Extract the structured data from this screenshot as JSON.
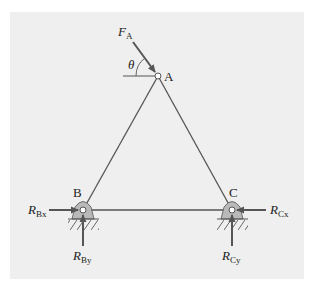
{
  "diagram": {
    "type": "truss-free-body-diagram",
    "colors": {
      "background": "#ffffff",
      "panel": "#efefef",
      "member": "#555555",
      "support_fill": "#b9b9b9",
      "hatch": "#666666",
      "text": "#222222"
    },
    "nodes": {
      "A": {
        "label": "A",
        "x": 158,
        "y": 76
      },
      "B": {
        "label": "B",
        "x": 83,
        "y": 210
      },
      "C": {
        "label": "C",
        "x": 232,
        "y": 210
      }
    },
    "members": [
      {
        "from": "A",
        "to": "B"
      },
      {
        "from": "A",
        "to": "C"
      },
      {
        "from": "B",
        "to": "C"
      }
    ],
    "angle": {
      "symbol": "θ",
      "at": "A",
      "reference": "horizontal"
    },
    "forces": {
      "F_A": {
        "main": "F",
        "sub": "A",
        "at": "A"
      },
      "R_Bx": {
        "main": "R",
        "sub": "Bx",
        "at": "B",
        "direction": "right"
      },
      "R_By": {
        "main": "R",
        "sub": "By",
        "at": "B",
        "direction": "up"
      },
      "R_Cx": {
        "main": "R",
        "sub": "Cx",
        "at": "C",
        "direction": "left"
      },
      "R_Cy": {
        "main": "R",
        "sub": "Cy",
        "at": "C",
        "direction": "up"
      }
    },
    "supports": [
      {
        "at": "B",
        "type": "pin"
      },
      {
        "at": "C",
        "type": "pin"
      }
    ]
  }
}
